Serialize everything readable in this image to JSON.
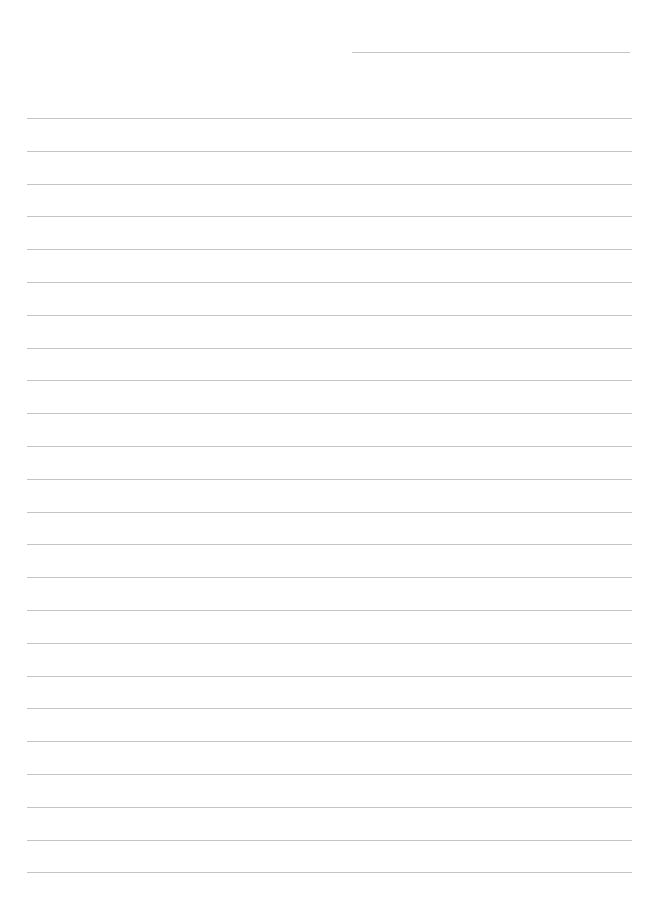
{
  "page": {
    "type": "lined-paper",
    "background": "#ffffff",
    "line_color": "#c4c4c4",
    "header_line": {
      "present": true
    },
    "ruled_lines": {
      "count": 24,
      "first_y": 118,
      "spacing": 32.8
    }
  }
}
